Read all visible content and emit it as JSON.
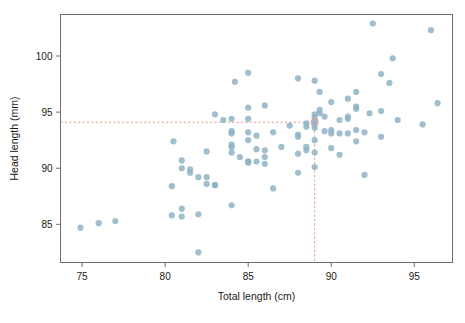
{
  "chart_data": {
    "type": "scatter",
    "title": "",
    "xlabel": "Total length (cm)",
    "ylabel": "Head length (mm)",
    "xlim": [
      73.7,
      97.3
    ],
    "ylim": [
      81.6,
      103.7
    ],
    "xticks": [
      75,
      80,
      85,
      90,
      95
    ],
    "yticks": [
      85,
      90,
      95,
      100
    ],
    "grid": false,
    "legend": null,
    "marker": {
      "color": "#8fb3c4",
      "opacity": 0.85,
      "radius": 3.1,
      "shape": "circle"
    },
    "reference_lines": {
      "color": "#e79b8c",
      "style": "dashed",
      "vertical_x": 89,
      "horizontal_y": 94.1,
      "highlight_point": [
        89,
        94.1
      ]
    },
    "points": [
      [
        74.9,
        84.7
      ],
      [
        76.0,
        85.1
      ],
      [
        77.0,
        85.3
      ],
      [
        80.4,
        85.8
      ],
      [
        80.4,
        88.4
      ],
      [
        80.5,
        92.4
      ],
      [
        81.0,
        90.7
      ],
      [
        81.0,
        90.0
      ],
      [
        81.0,
        86.4
      ],
      [
        81.0,
        85.7
      ],
      [
        81.5,
        89.9
      ],
      [
        81.5,
        89.6
      ],
      [
        82.0,
        89.2
      ],
      [
        82.0,
        85.9
      ],
      [
        82.0,
        82.5
      ],
      [
        82.5,
        89.2
      ],
      [
        82.5,
        88.6
      ],
      [
        82.5,
        91.5
      ],
      [
        83.0,
        88.5
      ],
      [
        83.0,
        88.5
      ],
      [
        83.0,
        94.8
      ],
      [
        83.5,
        94.3
      ],
      [
        84.0,
        94.4
      ],
      [
        84.0,
        93.3
      ],
      [
        84.0,
        93.1
      ],
      [
        84.0,
        92.1
      ],
      [
        84.0,
        91.9
      ],
      [
        84.0,
        91.4
      ],
      [
        84.0,
        86.7
      ],
      [
        84.2,
        97.7
      ],
      [
        84.5,
        91.0
      ],
      [
        85.0,
        98.5
      ],
      [
        85.0,
        95.4
      ],
      [
        85.0,
        94.4
      ],
      [
        85.0,
        93.2
      ],
      [
        85.0,
        92.5
      ],
      [
        85.0,
        90.6
      ],
      [
        85.0,
        90.6
      ],
      [
        85.0,
        90.5
      ],
      [
        85.5,
        92.9
      ],
      [
        85.5,
        91.7
      ],
      [
        85.5,
        90.6
      ],
      [
        86.0,
        95.6
      ],
      [
        86.0,
        91.6
      ],
      [
        86.0,
        91.0
      ],
      [
        86.0,
        90.4
      ],
      [
        86.5,
        93.2
      ],
      [
        86.5,
        88.2
      ],
      [
        87.0,
        91.9
      ],
      [
        87.5,
        93.8
      ],
      [
        88.0,
        98.0
      ],
      [
        88.0,
        93.0
      ],
      [
        88.0,
        92.8
      ],
      [
        88.0,
        91.3
      ],
      [
        88.0,
        89.6
      ],
      [
        88.5,
        94.0
      ],
      [
        88.5,
        93.7
      ],
      [
        88.5,
        91.9
      ],
      [
        88.5,
        91.6
      ],
      [
        89.0,
        97.8
      ],
      [
        89.0,
        94.8
      ],
      [
        89.0,
        94.5
      ],
      [
        89.0,
        94.2
      ],
      [
        89.0,
        93.9
      ],
      [
        89.0,
        93.6
      ],
      [
        89.0,
        92.5
      ],
      [
        89.0,
        91.4
      ],
      [
        89.0,
        90.1
      ],
      [
        89.3,
        96.8
      ],
      [
        89.3,
        95.2
      ],
      [
        89.3,
        94.9
      ],
      [
        89.6,
        94.6
      ],
      [
        89.6,
        93.3
      ],
      [
        90.0,
        95.9
      ],
      [
        90.0,
        93.4
      ],
      [
        90.0,
        93.1
      ],
      [
        90.0,
        91.8
      ],
      [
        90.5,
        94.3
      ],
      [
        90.5,
        93.1
      ],
      [
        90.5,
        91.2
      ],
      [
        91.0,
        96.2
      ],
      [
        91.0,
        94.6
      ],
      [
        91.0,
        94.4
      ],
      [
        91.0,
        93.1
      ],
      [
        91.5,
        96.8
      ],
      [
        91.5,
        95.5
      ],
      [
        91.5,
        95.3
      ],
      [
        91.5,
        93.4
      ],
      [
        91.5,
        92.4
      ],
      [
        92.0,
        93.2
      ],
      [
        92.0,
        89.4
      ],
      [
        92.3,
        94.9
      ],
      [
        92.5,
        102.9
      ],
      [
        93.0,
        98.4
      ],
      [
        93.0,
        95.1
      ],
      [
        93.0,
        92.8
      ],
      [
        93.5,
        97.6
      ],
      [
        93.7,
        99.8
      ],
      [
        94.0,
        94.3
      ],
      [
        95.5,
        93.9
      ],
      [
        96.0,
        102.3
      ],
      [
        96.4,
        95.8
      ]
    ]
  }
}
